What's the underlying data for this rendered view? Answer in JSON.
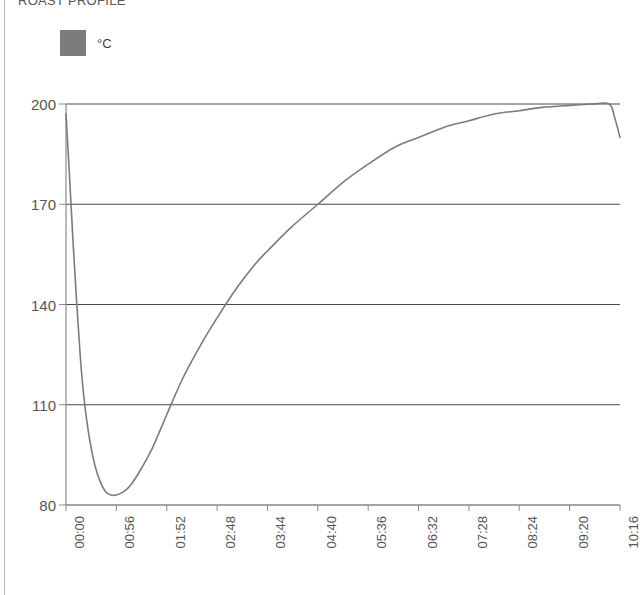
{
  "title": "ROAST PROFILE",
  "legend": {
    "swatch_color": "#7c7c7c",
    "label": "°C"
  },
  "colors": {
    "line": "#7b7b7b",
    "grid": "#4a4a4a",
    "axis": "#8a8a8a",
    "text": "#555555",
    "frame": "#b9b9b9"
  },
  "chart_data": {
    "type": "line",
    "title": "ROAST PROFILE",
    "xlabel": "",
    "ylabel": "",
    "ylim": [
      80,
      200
    ],
    "yticks": [
      80,
      110,
      140,
      170,
      200
    ],
    "grid": true,
    "legend_position": "top-left",
    "x_tick_labels": [
      "00:00",
      "00:56",
      "01:52",
      "02:48",
      "03:44",
      "04:40",
      "05:36",
      "06:32",
      "07:28",
      "08:24",
      "09:20",
      "10:16"
    ],
    "x_tick_minutes": [
      0,
      56,
      112,
      168,
      224,
      280,
      336,
      392,
      448,
      504,
      560,
      616
    ],
    "series": [
      {
        "name": "°C",
        "unit": "°C",
        "color": "#7b7b7b",
        "x": [
          0,
          4,
          8,
          12,
          16,
          20,
          26,
          32,
          38,
          44,
          50,
          56,
          64,
          72,
          84,
          96,
          112,
          130,
          150,
          168,
          190,
          210,
          224,
          250,
          280,
          310,
          336,
          365,
          392,
          420,
          448,
          476,
          504,
          530,
          560,
          585,
          604,
          610,
          616
        ],
        "values": [
          197,
          178,
          158,
          140,
          124,
          112,
          100,
          92,
          87,
          84,
          83,
          83,
          84,
          86,
          91,
          97,
          107,
          118,
          128,
          136,
          145,
          152,
          156,
          163,
          170,
          177,
          182,
          187,
          190,
          193,
          195,
          197,
          198,
          199,
          199.6,
          200,
          200,
          196,
          190
        ]
      }
    ],
    "annotations": {
      "start_value": 197,
      "minimum_value": 83,
      "minimum_time": "00:50",
      "peak_value": 200,
      "end_value": 190
    }
  }
}
